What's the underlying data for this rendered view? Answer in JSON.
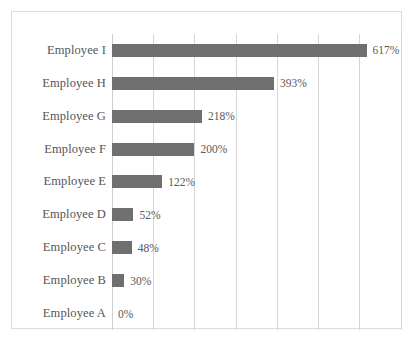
{
  "chart_data": {
    "type": "bar",
    "orientation": "horizontal",
    "title": "",
    "subtitle": "",
    "xlabel": "",
    "ylabel": "",
    "categories": [
      "Employee I",
      "Employee H",
      "Employee G",
      "Employee F",
      "Employee E",
      "Employee D",
      "Employee C",
      "Employee B",
      "Employee A"
    ],
    "values": [
      617,
      393,
      218,
      200,
      122,
      52,
      48,
      30,
      0
    ],
    "data_labels": [
      "617%",
      "393%",
      "218%",
      "200%",
      "122%",
      "52%",
      "48%",
      "30%",
      "0%"
    ],
    "value_unit": "%",
    "xlim": [
      0,
      700
    ],
    "xtick_values": [
      0,
      100,
      200,
      300,
      400,
      500,
      600,
      700
    ],
    "xtick_labels": [],
    "x_axis_labels_visible": false,
    "gridlines": "vertical",
    "grid": true,
    "legend": null,
    "legend_position": "none",
    "series": [
      {
        "name": "Percent",
        "values": [
          617,
          393,
          218,
          200,
          122,
          52,
          48,
          30,
          0
        ]
      }
    ],
    "colors": {
      "bar": "#6f6f6f",
      "gridline": "#d6d6d6",
      "frame": "#dcdcdc",
      "category_label": "#555555",
      "value_label": "#5a5a5a",
      "background": "#ffffff"
    }
  }
}
